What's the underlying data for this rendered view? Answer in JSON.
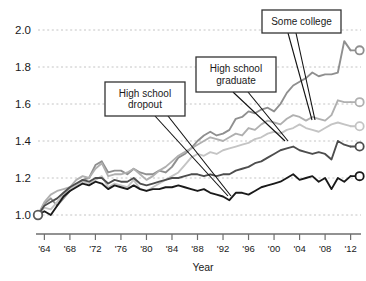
{
  "chart_data": {
    "type": "line",
    "title": "",
    "subtitle": "",
    "xlabel": "Year",
    "ylabel": "",
    "xlim": [
      1963,
      2013
    ],
    "ylim": [
      1.0,
      2.0
    ],
    "grid": true,
    "legend_position": "inline-callouts",
    "x_tick_labels": [
      "'64",
      "'68",
      "'72",
      "'76",
      "'80",
      "'84",
      "'88",
      "'92",
      "'96",
      "'00",
      "'04",
      "'08",
      "'12"
    ],
    "x_tick_values": [
      1964,
      1968,
      1972,
      1976,
      1980,
      1984,
      1988,
      1992,
      1996,
      2000,
      2004,
      2008,
      2012
    ],
    "y_tick_labels": [
      "1.0",
      "1.2",
      "1.4",
      "1.6",
      "1.8",
      "2.0"
    ],
    "y_tick_values": [
      1.0,
      1.2,
      1.4,
      1.6,
      1.8,
      2.0
    ],
    "x": [
      1963,
      1964,
      1965,
      1966,
      1967,
      1968,
      1969,
      1970,
      1971,
      1972,
      1973,
      1974,
      1975,
      1976,
      1977,
      1978,
      1979,
      1980,
      1981,
      1982,
      1983,
      1984,
      1985,
      1986,
      1987,
      1988,
      1989,
      1990,
      1991,
      1992,
      1993,
      1994,
      1995,
      1996,
      1997,
      1998,
      1999,
      2000,
      2001,
      2002,
      2003,
      2004,
      2005,
      2006,
      2007,
      2008,
      2009,
      2010,
      2011,
      2012
    ],
    "series": [
      {
        "name": "Advanced degree",
        "color": "#8f8f8f",
        "end_value": 1.89,
        "end_marker": "open-circle",
        "values": [
          1.0,
          1.06,
          1.09,
          1.05,
          1.09,
          1.13,
          1.16,
          1.19,
          1.2,
          1.27,
          1.29,
          1.23,
          1.24,
          1.24,
          1.22,
          1.25,
          1.23,
          1.22,
          1.22,
          1.24,
          1.23,
          1.26,
          1.31,
          1.33,
          1.36,
          1.4,
          1.43,
          1.45,
          1.43,
          1.44,
          1.46,
          1.52,
          1.53,
          1.56,
          1.55,
          1.57,
          1.58,
          1.56,
          1.6,
          1.66,
          1.7,
          1.72,
          1.74,
          1.77,
          1.75,
          1.76,
          1.76,
          1.77,
          1.94,
          1.89
        ]
      },
      {
        "name": "College graduate",
        "color": "#b0b0b0",
        "end_value": 1.61,
        "end_marker": "open-circle",
        "values": [
          1.0,
          1.07,
          1.11,
          1.13,
          1.14,
          1.15,
          1.19,
          1.21,
          1.2,
          1.25,
          1.28,
          1.21,
          1.22,
          1.22,
          1.23,
          1.25,
          1.22,
          1.19,
          1.21,
          1.24,
          1.26,
          1.29,
          1.32,
          1.34,
          1.36,
          1.38,
          1.4,
          1.42,
          1.41,
          1.4,
          1.42,
          1.44,
          1.43,
          1.47,
          1.46,
          1.49,
          1.51,
          1.5,
          1.49,
          1.52,
          1.54,
          1.53,
          1.51,
          1.53,
          1.52,
          1.51,
          1.54,
          1.62,
          1.61,
          1.61
        ]
      },
      {
        "name": "Some college",
        "color": "#c4c4c4",
        "end_value": 1.48,
        "end_marker": "open-circle",
        "values": [
          1.0,
          1.04,
          1.03,
          1.07,
          1.11,
          1.14,
          1.16,
          1.18,
          1.17,
          1.19,
          1.21,
          1.15,
          1.17,
          1.16,
          1.15,
          1.19,
          1.14,
          1.13,
          1.15,
          1.17,
          1.19,
          1.21,
          1.23,
          1.27,
          1.31,
          1.33,
          1.32,
          1.34,
          1.33,
          1.35,
          1.36,
          1.37,
          1.38,
          1.39,
          1.41,
          1.42,
          1.44,
          1.45,
          1.44,
          1.46,
          1.47,
          1.49,
          1.47,
          1.46,
          1.45,
          1.47,
          1.49,
          1.5,
          1.49,
          1.48
        ]
      },
      {
        "name": "High school graduate",
        "color": "#4d4d4d",
        "end_value": 1.37,
        "end_marker": "open-circle",
        "values": [
          1.0,
          1.05,
          1.07,
          1.09,
          1.12,
          1.15,
          1.17,
          1.19,
          1.18,
          1.2,
          1.2,
          1.17,
          1.19,
          1.18,
          1.18,
          1.2,
          1.17,
          1.16,
          1.17,
          1.18,
          1.19,
          1.2,
          1.2,
          1.21,
          1.22,
          1.22,
          1.21,
          1.22,
          1.21,
          1.22,
          1.22,
          1.24,
          1.25,
          1.26,
          1.28,
          1.29,
          1.31,
          1.33,
          1.35,
          1.36,
          1.37,
          1.35,
          1.34,
          1.33,
          1.34,
          1.33,
          1.3,
          1.4,
          1.38,
          1.37
        ]
      },
      {
        "name": "High school dropout",
        "color": "#1a1a1a",
        "end_value": 1.21,
        "end_marker": "open-circle",
        "values": [
          1.0,
          1.02,
          1.0,
          1.05,
          1.1,
          1.13,
          1.15,
          1.17,
          1.16,
          1.18,
          1.17,
          1.14,
          1.16,
          1.15,
          1.14,
          1.16,
          1.14,
          1.13,
          1.14,
          1.14,
          1.15,
          1.15,
          1.16,
          1.15,
          1.14,
          1.13,
          1.14,
          1.12,
          1.11,
          1.1,
          1.08,
          1.12,
          1.12,
          1.11,
          1.13,
          1.15,
          1.16,
          1.17,
          1.18,
          1.2,
          1.22,
          1.19,
          1.2,
          1.21,
          1.18,
          1.2,
          1.14,
          1.2,
          1.18,
          1.21
        ]
      }
    ],
    "annotations": [
      {
        "id": "high-school-dropout",
        "lines": [
          "High school",
          "dropout"
        ],
        "box": {
          "x": 105,
          "y": 82,
          "w": 80,
          "h": 34
        },
        "leaders": [
          {
            "x1": 155,
            "y1": 116,
            "x2": 228,
            "y2": 196
          },
          {
            "x1": 168,
            "y1": 116,
            "x2": 231,
            "y2": 196
          }
        ]
      },
      {
        "id": "high-school-graduate",
        "lines": [
          "High school",
          "graduate"
        ],
        "box": {
          "x": 196,
          "y": 57,
          "w": 80,
          "h": 35
        },
        "leaders": [
          {
            "x1": 233,
            "y1": 92,
            "x2": 285,
            "y2": 141
          },
          {
            "x1": 248,
            "y1": 92,
            "x2": 288,
            "y2": 141
          }
        ]
      },
      {
        "id": "some-college",
        "lines": [
          "Some college"
        ],
        "box": {
          "x": 262,
          "y": 10,
          "w": 79,
          "h": 23
        },
        "leaders": [
          {
            "x1": 288,
            "y1": 33,
            "x2": 312,
            "y2": 120
          },
          {
            "x1": 296,
            "y1": 33,
            "x2": 315,
            "y2": 120
          }
        ]
      }
    ]
  },
  "axes": {
    "x_title": "Year"
  },
  "colors": {
    "background": "#ffffff",
    "axis": "#6e6e6e",
    "gridline": "#bdbdbd",
    "text": "#1a1a1a",
    "callout_border": "#333333"
  }
}
